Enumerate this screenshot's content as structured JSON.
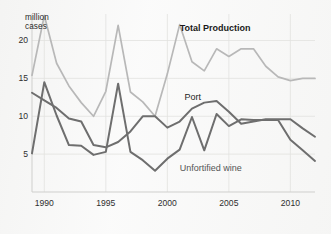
{
  "chart_data": {
    "type": "line",
    "title": "",
    "subtitle": "",
    "xlabel": "",
    "ylabel": "million\ncases",
    "ylabel_lines": [
      "million",
      "cases"
    ],
    "xlim": [
      1989,
      2012
    ],
    "ylim": [
      0,
      23.5
    ],
    "yticks": [
      5,
      10,
      15,
      20
    ],
    "ytick_labels": [
      "5",
      "10",
      "15",
      "20"
    ],
    "xticks": [
      1990,
      1995,
      2000,
      2005,
      2010
    ],
    "xtick_labels": [
      "1990",
      "1995",
      "2000",
      "2005",
      "2010"
    ],
    "grid": true,
    "grid_color": "#e2e2e0",
    "legend": "inline-annotations",
    "x": [
      1989,
      1990,
      1991,
      1992,
      1993,
      1994,
      1995,
      1996,
      1997,
      1998,
      1999,
      2000,
      2001,
      2002,
      2003,
      2004,
      2005,
      2006,
      2007,
      2008,
      2009,
      2010,
      2011,
      2012
    ],
    "series": [
      {
        "name": "Total Production",
        "color": "#b8b8b8",
        "width": 1.7,
        "values": [
          15.4,
          23.3,
          17.0,
          14.0,
          11.8,
          10.0,
          13.3,
          22.0,
          13.2,
          11.9,
          10.0,
          15.6,
          22.1,
          17.2,
          16.0,
          18.9,
          17.9,
          18.9,
          18.9,
          16.6,
          15.2,
          14.7,
          15.0,
          15.0
        ]
      },
      {
        "name": "Port",
        "color": "#6e6e6e",
        "width": 2.0,
        "values": [
          13.1,
          12.1,
          11.1,
          9.7,
          9.3,
          6.2,
          5.9,
          6.6,
          8.0,
          10.0,
          10.0,
          8.5,
          9.3,
          11.0,
          11.8,
          12.0,
          10.6,
          9.0,
          9.3,
          9.6,
          9.6,
          9.6,
          8.4,
          7.3
        ]
      },
      {
        "name": "Unfortified wine",
        "color": "#6e6e6e",
        "width": 2.0,
        "values": [
          5.1,
          14.5,
          10.1,
          6.2,
          6.1,
          4.9,
          5.3,
          14.3,
          5.3,
          4.2,
          2.8,
          4.4,
          5.6,
          9.9,
          5.5,
          10.3,
          8.7,
          9.6,
          9.5,
          9.5,
          9.5,
          6.9,
          5.5,
          4.1
        ]
      }
    ],
    "annotations": [
      {
        "text": "Total Production",
        "x": 2001,
        "y": 21.5,
        "style": "bold"
      },
      {
        "text": "Port",
        "x": 2001.4,
        "y": 12.4,
        "style": "normal"
      },
      {
        "text": "Unfortified wine",
        "x": 2001.0,
        "y": 3.1,
        "style": "light"
      }
    ]
  },
  "axis": {
    "unit_label_line1": "million",
    "unit_label_line2": "cases"
  }
}
